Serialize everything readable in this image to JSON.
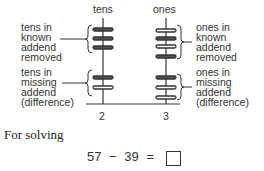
{
  "diagram": {
    "columns": [
      {
        "id": "tens",
        "label": "tens",
        "upper_beads": 3,
        "lower_beads": 2,
        "digit": "2"
      },
      {
        "id": "ones",
        "label": "ones",
        "upper_beads": 4,
        "lower_beads": 3,
        "digit": "3"
      }
    ],
    "labels": {
      "tens_known": "tens in\nknown\naddend\nremoved",
      "tens_missing": "tens in\nmissing\naddend\n(difference)",
      "ones_known": "ones in\nknown\naddend\nremoved",
      "ones_missing": "ones in\nmissing\naddend\n(difference)"
    }
  },
  "caption": "For solving",
  "equation": {
    "left": "57",
    "op": "−",
    "right": "39",
    "eq": "="
  }
}
